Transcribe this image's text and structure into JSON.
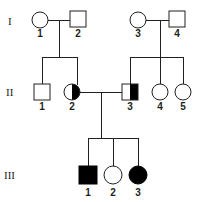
{
  "figure": {
    "kind": "pedigree-chart",
    "background_color": "#ffffff",
    "line_color": "#231f20",
    "fill_affected_color": "#000000",
    "fill_unaffected_color": "#ffffff",
    "width": 197,
    "height": 202
  },
  "generations": [
    {
      "label": "I",
      "y": 22
    },
    {
      "label": "II",
      "y": 92
    },
    {
      "label": "III",
      "y": 175
    }
  ],
  "individuals": [
    {
      "id": "I-1",
      "generation": "I",
      "number": "1",
      "shape": "circle",
      "status": "unaffected",
      "fill": "open",
      "x": 40,
      "y": 20
    },
    {
      "id": "I-2",
      "generation": "I",
      "number": "2",
      "shape": "square",
      "status": "unaffected",
      "fill": "open",
      "x": 78,
      "y": 20
    },
    {
      "id": "I-3",
      "generation": "I",
      "number": "3",
      "shape": "circle",
      "status": "unaffected",
      "fill": "open",
      "x": 138,
      "y": 20
    },
    {
      "id": "I-4",
      "generation": "I",
      "number": "4",
      "shape": "square",
      "status": "unaffected",
      "fill": "open",
      "x": 177,
      "y": 20
    },
    {
      "id": "II-1",
      "generation": "II",
      "number": "1",
      "shape": "square",
      "status": "unaffected",
      "fill": "open",
      "x": 42,
      "y": 92
    },
    {
      "id": "II-2",
      "generation": "II",
      "number": "2",
      "shape": "circle",
      "status": "carrier",
      "fill": "half-right",
      "x": 72,
      "y": 92
    },
    {
      "id": "II-3",
      "generation": "II",
      "number": "3",
      "shape": "square",
      "status": "carrier",
      "fill": "half-right",
      "x": 130,
      "y": 92
    },
    {
      "id": "II-4",
      "generation": "II",
      "number": "4",
      "shape": "circle",
      "status": "unaffected",
      "fill": "open",
      "x": 160,
      "y": 92
    },
    {
      "id": "II-5",
      "generation": "II",
      "number": "5",
      "shape": "circle",
      "status": "unaffected",
      "fill": "open",
      "x": 183,
      "y": 92
    },
    {
      "id": "III-1",
      "generation": "III",
      "number": "1",
      "shape": "square",
      "status": "affected",
      "fill": "full",
      "x": 88,
      "y": 175
    },
    {
      "id": "III-2",
      "generation": "III",
      "number": "2",
      "shape": "circle",
      "status": "unaffected",
      "fill": "open",
      "x": 113,
      "y": 175
    },
    {
      "id": "III-3",
      "generation": "III",
      "number": "3",
      "shape": "circle",
      "status": "affected",
      "fill": "full",
      "x": 138,
      "y": 175
    }
  ],
  "matings": [
    {
      "id": "mating-1",
      "partners": [
        "I-1",
        "I-2"
      ],
      "children": [
        "II-1",
        "II-2"
      ]
    },
    {
      "id": "mating-2",
      "partners": [
        "I-3",
        "I-4"
      ],
      "children": [
        "II-3",
        "II-4",
        "II-5"
      ]
    },
    {
      "id": "mating-3",
      "partners": [
        "II-2",
        "II-3"
      ],
      "children": [
        "III-1",
        "III-2",
        "III-3"
      ]
    }
  ]
}
